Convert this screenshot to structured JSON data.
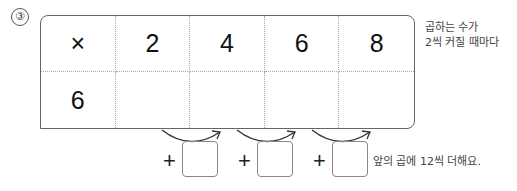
{
  "problem": {
    "number_label": "③",
    "table": {
      "header_row": [
        "×",
        "2",
        "4",
        "6",
        "8"
      ],
      "body_row": [
        "6",
        "",
        "",
        "",
        ""
      ]
    },
    "side_note": {
      "line1": "곱하는 수가",
      "line2": "2씩 커질 때마다"
    },
    "plus_items": [
      {
        "sign": "+",
        "value": ""
      },
      {
        "sign": "+",
        "value": ""
      },
      {
        "sign": "+",
        "value": ""
      }
    ],
    "hint": "앞의 곱에 12씩 더해요."
  }
}
